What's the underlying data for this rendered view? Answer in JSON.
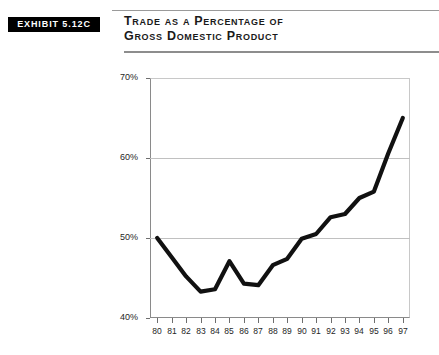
{
  "exhibit": {
    "badge_label": "EXHIBIT 5.12C"
  },
  "title": {
    "line1": "Trade as a Percentage of",
    "line2": "Gross Domestic Product"
  },
  "colors": {
    "badge_background": "#000000",
    "badge_text": "#ffffff",
    "line": "#111111",
    "gridline": "#c0c0c0",
    "axis": "#8a8a8a",
    "text": "#1a1a1a"
  },
  "chart_data": {
    "type": "line",
    "title": "Trade as a Percentage of Gross Domestic Product",
    "xlabel": "",
    "ylabel": "",
    "ylim": [
      40,
      70
    ],
    "yticks": [
      40,
      50,
      60,
      70
    ],
    "ytick_labels": [
      "40%",
      "50%",
      "60%",
      "70%"
    ],
    "grid": true,
    "legend": "none",
    "categories": [
      "80",
      "81",
      "82",
      "83",
      "84",
      "85",
      "86",
      "87",
      "88",
      "89",
      "90",
      "91",
      "92",
      "93",
      "94",
      "95",
      "96",
      "97"
    ],
    "x": [
      1980,
      1981,
      1982,
      1983,
      1984,
      1985,
      1986,
      1987,
      1988,
      1989,
      1990,
      1991,
      1992,
      1993,
      1994,
      1995,
      1996,
      1997
    ],
    "series": [
      {
        "name": "Trade as % of GDP",
        "values": [
          50.0,
          47.6,
          45.2,
          43.3,
          43.6,
          47.1,
          44.3,
          44.1,
          46.6,
          47.4,
          49.9,
          50.5,
          52.6,
          53.0,
          55.0,
          55.8,
          60.6,
          65.0
        ]
      }
    ]
  }
}
